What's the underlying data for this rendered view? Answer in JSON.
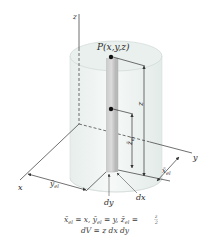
{
  "figure": {
    "axes": {
      "x_label": "x",
      "y_label": "y",
      "z_label": "z"
    },
    "point_label": "P(x,y,z)",
    "dimension_labels": {
      "z_height": "z",
      "z_centroid": "z̄",
      "z_centroid_sub": "el",
      "x_centroid": "x̄",
      "x_centroid_sub": "el",
      "y_centroid": "ȳ",
      "y_centroid_sub": "el",
      "dy": "dy",
      "dx": "dx"
    },
    "equations": {
      "line1": {
        "x_part": "x̄",
        "x_sub": "el",
        "x_rhs": " = x,  ",
        "y_part": "ȳ",
        "y_sub": "el",
        "y_rhs": " = y,  ",
        "z_part": "z̄",
        "z_sub": "el",
        "z_rhs": " = ",
        "frac_num": "z",
        "frac_den": "2"
      },
      "line2": "dV = z dx dy"
    },
    "colors": {
      "cylinder_fill": "#eef3f1",
      "cylinder_top": "#e4ece9",
      "element_fill": "#cfcfcf",
      "element_shadow": "#b5b5b5",
      "axis": "#4a4a4a"
    }
  }
}
